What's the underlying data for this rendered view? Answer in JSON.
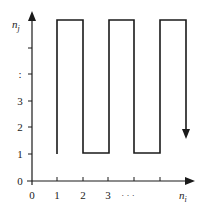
{
  "diagram": {
    "type": "step-path",
    "axes": {
      "x_label": "n",
      "x_label_sub": "i",
      "y_label": "n",
      "y_label_sub": "j"
    },
    "x_ticks": [
      {
        "label": "0",
        "px": 32
      },
      {
        "label": "1",
        "px": 57
      },
      {
        "label": "2",
        "px": 83
      },
      {
        "label": "3",
        "px": 108
      },
      {
        "label": "· · ·",
        "px": 128
      },
      {
        "label": "",
        "px": 134
      },
      {
        "label": "",
        "px": 160
      }
    ],
    "y_ticks": [
      {
        "label": "0",
        "py": 181
      },
      {
        "label": "1",
        "py": 154
      },
      {
        "label": "2",
        "py": 127
      },
      {
        "label": "3",
        "py": 101
      },
      {
        "label": ":",
        "py": 74
      },
      {
        "label": "",
        "py": 48
      }
    ],
    "path_description": "Square-wave path alternating between n_j = 1 and top level, ending with a downward arrow",
    "colors": {
      "line": "#1a1a1a",
      "text": "#222222",
      "background": "#ffffff"
    }
  }
}
